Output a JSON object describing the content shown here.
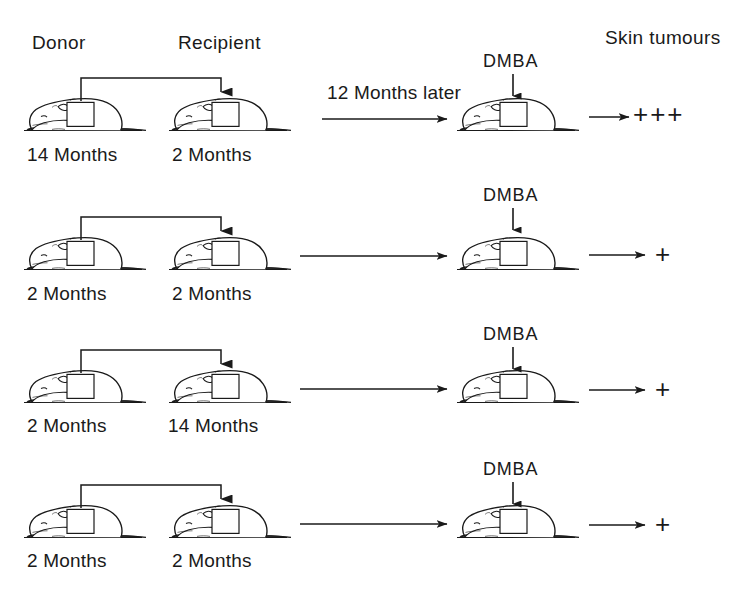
{
  "figure": {
    "title_present": false,
    "background_color": "#ffffff",
    "ink_color": "#1a1a1a"
  },
  "headers": {
    "donor": "Donor",
    "recipient": "Recipient",
    "outcome": "Skin tumours"
  },
  "interval": {
    "label": "12 Months later"
  },
  "treatment": {
    "label": "DMBA"
  },
  "rows": [
    {
      "donor_age": "14 Months",
      "recipient_age": "2 Months",
      "interval_label": "12 Months later",
      "treatment": "DMBA",
      "result": "+++"
    },
    {
      "donor_age": "2 Months",
      "recipient_age": "2 Months",
      "interval_label": "",
      "treatment": "DMBA",
      "result": "+"
    },
    {
      "donor_age": "2 Months",
      "recipient_age": "14 Months",
      "interval_label": "",
      "treatment": "DMBA",
      "result": "+"
    },
    {
      "donor_age": "2 Months",
      "recipient_age": "2 Months",
      "interval_label": "",
      "treatment": "DMBA",
      "result": "+"
    }
  ],
  "icons": {
    "mouse": "mouse-side-view-icon",
    "graft": "skin-graft-patch-icon",
    "transfer": "graft-transfer-arrow-icon",
    "timeline": "timeline-arrow-icon",
    "dmba": "dmba-application-arrow-icon",
    "outcome": "outcome-arrow-icon"
  }
}
